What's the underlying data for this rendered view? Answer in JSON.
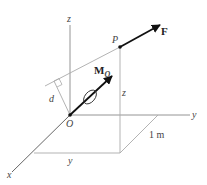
{
  "diagram": {
    "type": "3d-moment-vector-diagram",
    "labels": {
      "z_axis": "z",
      "y_axis": "y",
      "x_axis": "x",
      "origin": "O",
      "point": "P",
      "force": "F",
      "moment_main": "M",
      "moment_sub": "O",
      "distance": "d",
      "height": "z",
      "y_dimension": "y",
      "x_dimension": "1 m"
    },
    "colors": {
      "axis": "#777777",
      "vector": "#111111",
      "background": "#ffffff"
    }
  }
}
